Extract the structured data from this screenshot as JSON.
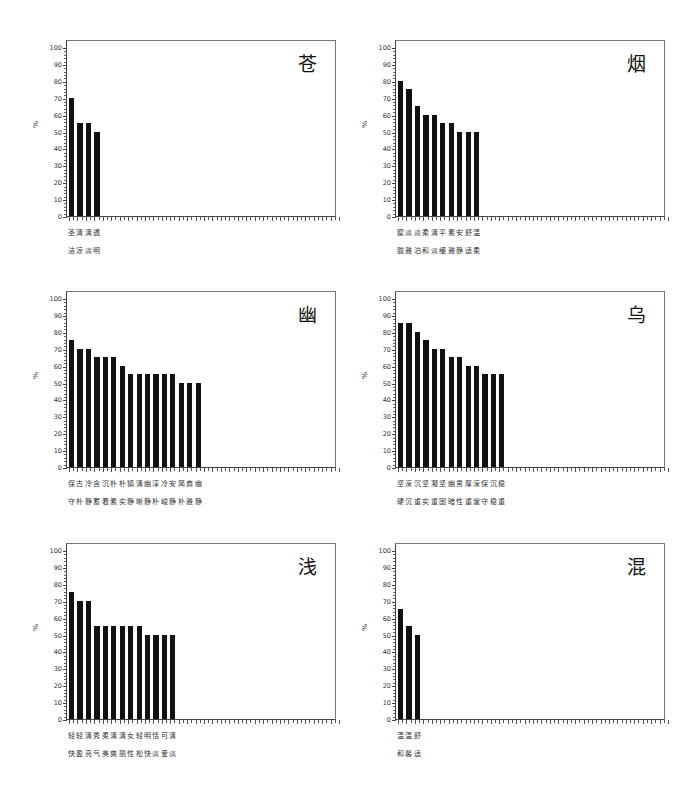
{
  "chart_data": [
    {
      "type": "bar",
      "title": "苍",
      "ylabel": "%",
      "xlabel": "",
      "ylim": [
        0,
        100
      ],
      "yticks": [
        0,
        10,
        20,
        30,
        40,
        50,
        60,
        70,
        80,
        90,
        100
      ],
      "categories": [
        "圣洁",
        "清凉",
        "清淡",
        "透明"
      ],
      "label_row1": "圣清清透",
      "label_row2": "洁凉淡明",
      "values": [
        70,
        55,
        55,
        50
      ],
      "grid": false,
      "legend": "none"
    },
    {
      "type": "bar",
      "title": "烟",
      "ylabel": "%",
      "xlabel": "",
      "ylim": [
        0,
        100
      ],
      "yticks": [
        0,
        10,
        20,
        30,
        40,
        50,
        60,
        70,
        80,
        90,
        100
      ],
      "categories": [
        "朦胧",
        "淡雅",
        "淡泊",
        "柔和",
        "清淡",
        "平缓",
        "素雅",
        "安静",
        "舒适",
        "温柔"
      ],
      "label_row1": "朦淡淡柔清平素安舒温",
      "label_row2": "胧雅泊和淡缓雅静适柔",
      "values": [
        80,
        75,
        65,
        60,
        60,
        55,
        55,
        50,
        50,
        50
      ],
      "grid": false,
      "legend": "none"
    },
    {
      "type": "bar",
      "title": "幽",
      "ylabel": "%",
      "xlabel": "",
      "ylim": [
        0,
        100
      ],
      "yticks": [
        0,
        10,
        20,
        30,
        40,
        50,
        60,
        70,
        80,
        90,
        100
      ],
      "categories": [
        "保守",
        "古朴",
        "冷静",
        "含蓄",
        "沉着",
        "朴素",
        "朴实",
        "镇静",
        "清晰",
        "幽静",
        "淳朴",
        "冷峻",
        "安静",
        "简朴",
        "典雅",
        "幽静"
      ],
      "label_row1": "保古冷含沉朴朴镇清幽淳冷安简典幽",
      "label_row2": "守朴静蓄着素实静晰静朴峻静朴雅静",
      "values": [
        75,
        70,
        70,
        65,
        65,
        65,
        60,
        55,
        55,
        55,
        55,
        55,
        55,
        50,
        50,
        50
      ],
      "grid": false,
      "legend": "none"
    },
    {
      "type": "bar",
      "title": "乌",
      "ylabel": "%",
      "xlabel": "",
      "ylim": [
        0,
        100
      ],
      "yticks": [
        0,
        10,
        20,
        30,
        40,
        50,
        60,
        70,
        80,
        90,
        100
      ],
      "categories": [
        "坚硬",
        "深沉",
        "沉重",
        "坚实",
        "凝重",
        "坚固",
        "幽暗",
        "男性",
        "厚重",
        "深邃",
        "保守",
        "沉稳",
        "稳重"
      ],
      "label_row1": "坚深沉坚凝坚幽男厚深保沉稳",
      "label_row2": "硬沉重实重固暗性重邃守稳重",
      "values": [
        85,
        85,
        80,
        75,
        70,
        70,
        65,
        65,
        60,
        60,
        55,
        55,
        55
      ],
      "grid": false,
      "legend": "none"
    },
    {
      "type": "bar",
      "title": "浅",
      "ylabel": "%",
      "xlabel": "",
      "ylim": [
        0,
        100
      ],
      "yticks": [
        0,
        10,
        20,
        30,
        40,
        50,
        60,
        70,
        80,
        90,
        100
      ],
      "categories": [
        "轻快",
        "轻盈",
        "清亮",
        "秀气",
        "柔美",
        "清爽",
        "清丽",
        "女性",
        "轻松",
        "明快",
        "恬淡",
        "可爱",
        "清淡"
      ],
      "label_row1": "轻轻清秀柔清清女轻明恬可清",
      "label_row2": "快盈亮气美爽丽性松快淡爱淡",
      "values": [
        75,
        70,
        70,
        55,
        55,
        55,
        55,
        55,
        55,
        50,
        50,
        50,
        50
      ],
      "grid": false,
      "legend": "none"
    },
    {
      "type": "bar",
      "title": "混",
      "ylabel": "%",
      "xlabel": "",
      "ylim": [
        0,
        100
      ],
      "yticks": [
        0,
        10,
        20,
        30,
        40,
        50,
        60,
        70,
        80,
        90,
        100
      ],
      "categories": [
        "温和",
        "温馨",
        "舒适"
      ],
      "label_row1": "温温舒",
      "label_row2": "和馨适",
      "values": [
        65,
        55,
        50
      ],
      "grid": false,
      "legend": "none"
    }
  ],
  "layout": {
    "bar_color": "#111111",
    "axis_color": "#444444",
    "slots": 32,
    "panels": [
      {
        "left": 30,
        "top": 40
      },
      {
        "left": 359,
        "top": 40
      },
      {
        "left": 30,
        "top": 291
      },
      {
        "left": 359,
        "top": 291
      },
      {
        "left": 30,
        "top": 543
      },
      {
        "left": 359,
        "top": 543
      }
    ]
  }
}
